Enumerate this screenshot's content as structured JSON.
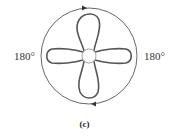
{
  "figure": {
    "caption": "(c)",
    "left_angle_label": "180°",
    "right_angle_label": "180°",
    "colors": {
      "stroke": "#555555",
      "outer_circle": "#666666",
      "text": "#333333"
    },
    "arrows": {
      "top": "clockwise-right",
      "bottom": "leftward"
    }
  }
}
